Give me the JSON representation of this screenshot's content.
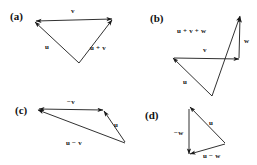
{
  "figure": {
    "background_color": "#ffffff",
    "stroke_color": "#1a1a1a",
    "text_color": "#111111",
    "width": 257,
    "height": 165
  },
  "panels": [
    {
      "id": "a",
      "label": "(a)",
      "label_pos": {
        "x": 10,
        "y": 11
      },
      "description": "Triangle showing vector addition u + v",
      "vectors": [
        {
          "name": "v",
          "label": "v",
          "from": {
            "x": 36,
            "y": 21
          },
          "to": {
            "x": 112,
            "y": 19
          },
          "arrow": "both",
          "label_pos": {
            "x": 71,
            "y": 8
          }
        },
        {
          "name": "u",
          "label": "u",
          "from": {
            "x": 79,
            "y": 63
          },
          "to": {
            "x": 35,
            "y": 22
          },
          "arrow": "end",
          "label_pos": {
            "x": 45,
            "y": 44
          }
        },
        {
          "name": "u-plus-v",
          "label": "u + v",
          "from": {
            "x": 79,
            "y": 63
          },
          "to": {
            "x": 112,
            "y": 20
          },
          "arrow": "end",
          "label_pos": {
            "x": 90,
            "y": 45
          }
        }
      ]
    },
    {
      "id": "b",
      "label": "(b)",
      "label_pos": {
        "x": 150,
        "y": 13
      },
      "description": "Three vectors u, v, w summing to u + v + w",
      "vectors": [
        {
          "name": "u-plus-v-plus-w",
          "label": "u + v + w",
          "from": {
            "x": 212,
            "y": 96
          },
          "to": {
            "x": 240,
            "y": 16
          },
          "arrow": "end",
          "label_pos": {
            "x": 177,
            "y": 28
          }
        },
        {
          "name": "w",
          "label": "w",
          "from": {
            "x": 239,
            "y": 58
          },
          "to": {
            "x": 240,
            "y": 17
          },
          "arrow": "end",
          "label_pos": {
            "x": 244,
            "y": 38
          }
        },
        {
          "name": "v",
          "label": "v",
          "from": {
            "x": 174,
            "y": 58
          },
          "to": {
            "x": 239,
            "y": 59
          },
          "arrow": "end",
          "label_pos": {
            "x": 203,
            "y": 47
          }
        },
        {
          "name": "u",
          "label": "u",
          "from": {
            "x": 212,
            "y": 96
          },
          "to": {
            "x": 173,
            "y": 58
          },
          "arrow": "end",
          "label_pos": {
            "x": 183,
            "y": 79
          }
        }
      ]
    },
    {
      "id": "c",
      "label": "(c)",
      "label_pos": {
        "x": 15,
        "y": 105
      },
      "description": "Triangle showing vector subtraction u - v",
      "vectors": [
        {
          "name": "minus-v",
          "label": "−v",
          "from": {
            "x": 103,
            "y": 110
          },
          "to": {
            "x": 39,
            "y": 109
          },
          "arrow": "both",
          "label_pos": {
            "x": 67,
            "y": 99
          }
        },
        {
          "name": "u",
          "label": "u",
          "from": {
            "x": 125,
            "y": 142
          },
          "to": {
            "x": 104,
            "y": 111
          },
          "arrow": "end",
          "label_pos": {
            "x": 114,
            "y": 122
          }
        },
        {
          "name": "u-minus-v",
          "label": "u − v",
          "from": {
            "x": 125,
            "y": 143
          },
          "to": {
            "x": 38,
            "y": 110
          },
          "arrow": "end",
          "label_pos": {
            "x": 66,
            "y": 140
          }
        }
      ]
    },
    {
      "id": "d",
      "label": "(d)",
      "label_pos": {
        "x": 145,
        "y": 110
      },
      "description": "Triangle showing vector subtraction u - w",
      "vectors": [
        {
          "name": "minus-w",
          "label": "−w",
          "from": {
            "x": 189,
            "y": 109
          },
          "to": {
            "x": 189,
            "y": 154
          },
          "arrow": "end",
          "label_pos": {
            "x": 174,
            "y": 130
          }
        },
        {
          "name": "u",
          "label": "u",
          "from": {
            "x": 225,
            "y": 143
          },
          "to": {
            "x": 190,
            "y": 107
          },
          "arrow": "end",
          "label_pos": {
            "x": 209,
            "y": 120
          }
        },
        {
          "name": "u-minus-w",
          "label": "u − w",
          "from": {
            "x": 225,
            "y": 144
          },
          "to": {
            "x": 190,
            "y": 154
          },
          "arrow": "end",
          "label_pos": {
            "x": 203,
            "y": 153
          }
        }
      ]
    }
  ]
}
